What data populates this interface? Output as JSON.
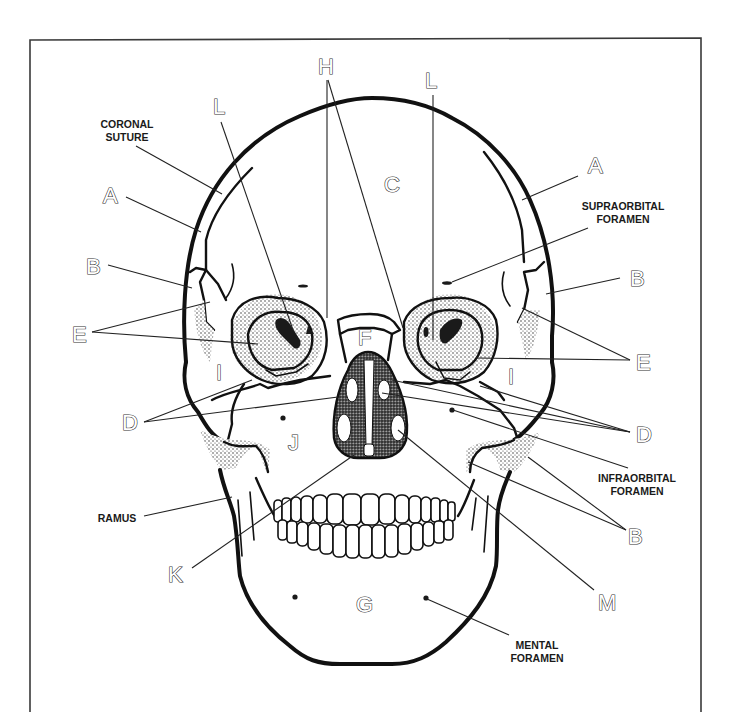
{
  "diagram": {
    "letters": {
      "A_left": "A",
      "A_right": "A",
      "B_left": "B",
      "B_right_upper": "B",
      "B_right_lower": "B",
      "C": "C",
      "D_left": "D",
      "D_right": "D",
      "E_left": "E",
      "E_right": "E",
      "F": "F",
      "G": "G",
      "H": "H",
      "I_left": "I",
      "I_right": "I",
      "J": "J",
      "K": "K",
      "L_left": "L",
      "L_right": "L",
      "M": "M"
    },
    "terms": {
      "coronal_suture_line1": "CORONAL",
      "coronal_suture_line2": "SUTURE",
      "supraorbital_foramen_line1": "SUPRAORBITAL",
      "supraorbital_foramen_line2": "FORAMEN",
      "infraorbital_foramen_line1": "INFRAORBITAL",
      "infraorbital_foramen_line2": "FORAMEN",
      "ramus": "RAMUS",
      "mental_foramen_line1": "MENTAL",
      "mental_foramen_line2": "FORAMEN"
    }
  }
}
